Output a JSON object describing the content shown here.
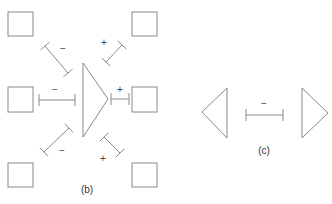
{
  "colors": {
    "stroke": "#8a8a8a",
    "text": "#333333",
    "background": "#ffffff"
  },
  "panel_b": {
    "label": "(b)",
    "boxes": [
      {
        "id": "top-left",
        "x": 8,
        "y": 12,
        "w": 25,
        "h": 24
      },
      {
        "id": "top-right",
        "x": 132,
        "y": 12,
        "w": 25,
        "h": 24
      },
      {
        "id": "mid-left",
        "x": 8,
        "y": 87,
        "w": 25,
        "h": 25
      },
      {
        "id": "mid-right",
        "x": 132,
        "y": 87,
        "w": 25,
        "h": 25
      },
      {
        "id": "bottom-left",
        "x": 8,
        "y": 163,
        "w": 25,
        "h": 24
      },
      {
        "id": "bottom-right",
        "x": 132,
        "y": 163,
        "w": 25,
        "h": 24
      }
    ],
    "triangle": {
      "direction": "right",
      "points": "83,63 83,137 108,99"
    },
    "connectors": [
      {
        "id": "top-left",
        "sign": "−",
        "x1": 45,
        "y1": 46,
        "x2": 68,
        "y2": 73
      },
      {
        "id": "mid-left",
        "sign": "−",
        "x1": 39,
        "y1": 100,
        "x2": 75,
        "y2": 100
      },
      {
        "id": "bottom-left",
        "sign": "−",
        "x1": 44,
        "y1": 152,
        "x2": 69,
        "y2": 128
      },
      {
        "id": "top-right",
        "sign": "+",
        "x1": 106,
        "y1": 62,
        "x2": 122,
        "y2": 45
      },
      {
        "id": "mid-right",
        "sign": "+",
        "x1": 111,
        "y1": 99,
        "x2": 129,
        "y2": 99
      },
      {
        "id": "bottom-right",
        "sign": "+",
        "x1": 104,
        "y1": 137,
        "x2": 120,
        "y2": 153
      }
    ],
    "signs": [
      {
        "id": "top-left",
        "text": "−",
        "x": 63,
        "y": 52
      },
      {
        "id": "mid-left",
        "text": "−",
        "x": 55,
        "y": 93
      },
      {
        "id": "bottom-left",
        "text": "−",
        "x": 62,
        "y": 154
      },
      {
        "id": "top-right",
        "text": "+",
        "x": 104,
        "y": 46
      },
      {
        "id": "mid-right",
        "text": "+",
        "x": 120,
        "y": 93
      },
      {
        "id": "bottom-right",
        "text": "+",
        "x": 103,
        "y": 162
      }
    ]
  },
  "panel_c": {
    "label": "(c)",
    "left_triangle": {
      "direction": "left",
      "points": "227,88 227,138 202,112"
    },
    "right_triangle": {
      "direction": "right",
      "points": "302,88 302,138 328,113"
    },
    "connector": {
      "sign": "−",
      "x1": 246,
      "y1": 115,
      "x2": 283,
      "y2": 115
    },
    "sign": {
      "text": "−",
      "x": 264,
      "y": 107
    }
  }
}
